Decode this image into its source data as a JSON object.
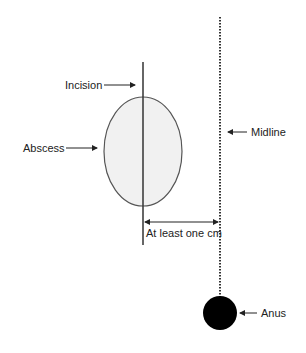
{
  "diagram": {
    "labels": {
      "incision": "Incision",
      "abscess": "Abscess",
      "midline": "Midline",
      "distance": "At least one cm",
      "anus": "Anus"
    },
    "colors": {
      "background": "#ffffff",
      "line": "#333333",
      "abscess_fill": "#f1f1f1",
      "abscess_stroke": "#555555",
      "anus_fill": "#000000",
      "text": "#222222"
    }
  }
}
